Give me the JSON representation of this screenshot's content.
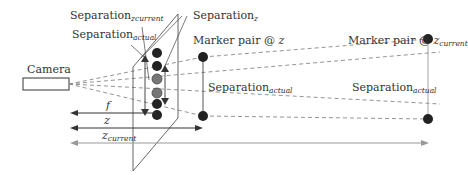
{
  "labels": {
    "camera": "Camera",
    "separation": "Separation",
    "sub_zcurrent": "zcurrent",
    "sub_z": "z",
    "sub_actual": "actual",
    "marker_pair_at": "Marker pair @ ",
    "z": "z",
    "z_current_base": "z",
    "current": "current",
    "f": "f"
  },
  "colors": {
    "line": "#333333",
    "gray_line": "#999999",
    "marker_black": "#222222",
    "marker_gray": "#777777",
    "dashed": "#888888"
  }
}
